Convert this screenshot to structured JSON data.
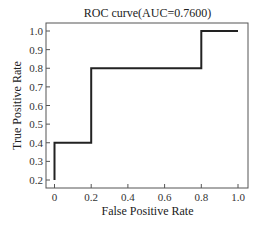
{
  "chart_data": {
    "type": "line",
    "title": "ROC curve(AUC=0.7600)",
    "xlabel": "False Positive Rate",
    "ylabel": "True Positive Rate",
    "xlim": [
      -0.05,
      1.05
    ],
    "ylim": [
      0.16,
      1.04
    ],
    "x_ticks": [
      "0",
      "0.2",
      "0.4",
      "0.6",
      "0.8",
      "1.0"
    ],
    "y_ticks": [
      "0.2",
      "0.3",
      "0.4",
      "0.5",
      "0.6",
      "0.7",
      "0.8",
      "0.9",
      "1.0"
    ],
    "grid": false,
    "legend": null,
    "series": [
      {
        "name": "ROC",
        "color": "#222222",
        "x": [
          0.0,
          0.0,
          0.2,
          0.2,
          0.8,
          0.8,
          1.0
        ],
        "y": [
          0.2,
          0.4,
          0.4,
          0.8,
          0.8,
          1.0,
          1.0
        ]
      }
    ],
    "auc": 0.76
  }
}
